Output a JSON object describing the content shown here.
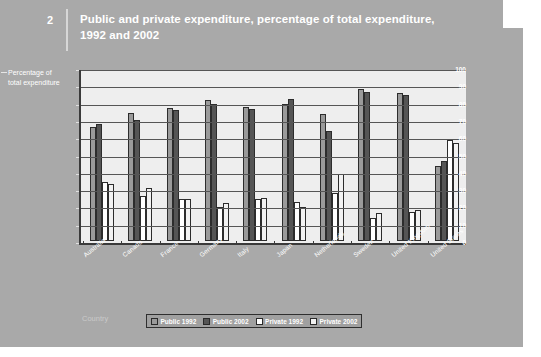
{
  "page": {
    "background_color": "#a9a9a9",
    "figure_number": "2",
    "title": "Public and private expenditure, percentage of total expenditure, 1992 and 2002"
  },
  "chart_data": {
    "type": "bar",
    "title": "Public and private expenditure, percentage of total expenditure, 1992 and 2002",
    "xlabel": "Country",
    "ylabel": "Percentage of total expenditure",
    "ylim": [
      0,
      100
    ],
    "yticks": [
      0,
      10,
      20,
      30,
      40,
      50,
      60,
      70,
      80,
      90,
      100
    ],
    "ytick_labels": [
      "0",
      "10",
      "20",
      "30",
      "40",
      "50",
      "60",
      "70",
      "80",
      "90",
      "100"
    ],
    "grid": true,
    "legend_position": "bottom",
    "categories": [
      "Australia",
      "Canada",
      "France",
      "Germany",
      "Italy",
      "Japan",
      "Netherlands",
      "Sweden",
      "United Kingdom",
      "United States"
    ],
    "series": [
      {
        "name": "Public 1992",
        "color": "#9a9a9a",
        "values": [
          66,
          74,
          77,
          81.5,
          77.5,
          79,
          73.5,
          88,
          85.5,
          43.5
        ]
      },
      {
        "name": "Public 2002",
        "color": "#555555",
        "values": [
          67.5,
          70,
          76,
          79,
          76.5,
          82,
          63.5,
          86,
          84.5,
          46
        ]
      },
      {
        "name": "Private 1992",
        "color": "#ffffff",
        "values": [
          34,
          26,
          24,
          19.5,
          24,
          22.5,
          28,
          13.5,
          17,
          58.5
        ]
      },
      {
        "name": "Private 2002",
        "color": "#f2f2f2",
        "values": [
          33,
          30.5,
          24.5,
          22,
          25,
          19.5,
          38.5,
          16,
          18,
          56.5
        ]
      }
    ]
  }
}
